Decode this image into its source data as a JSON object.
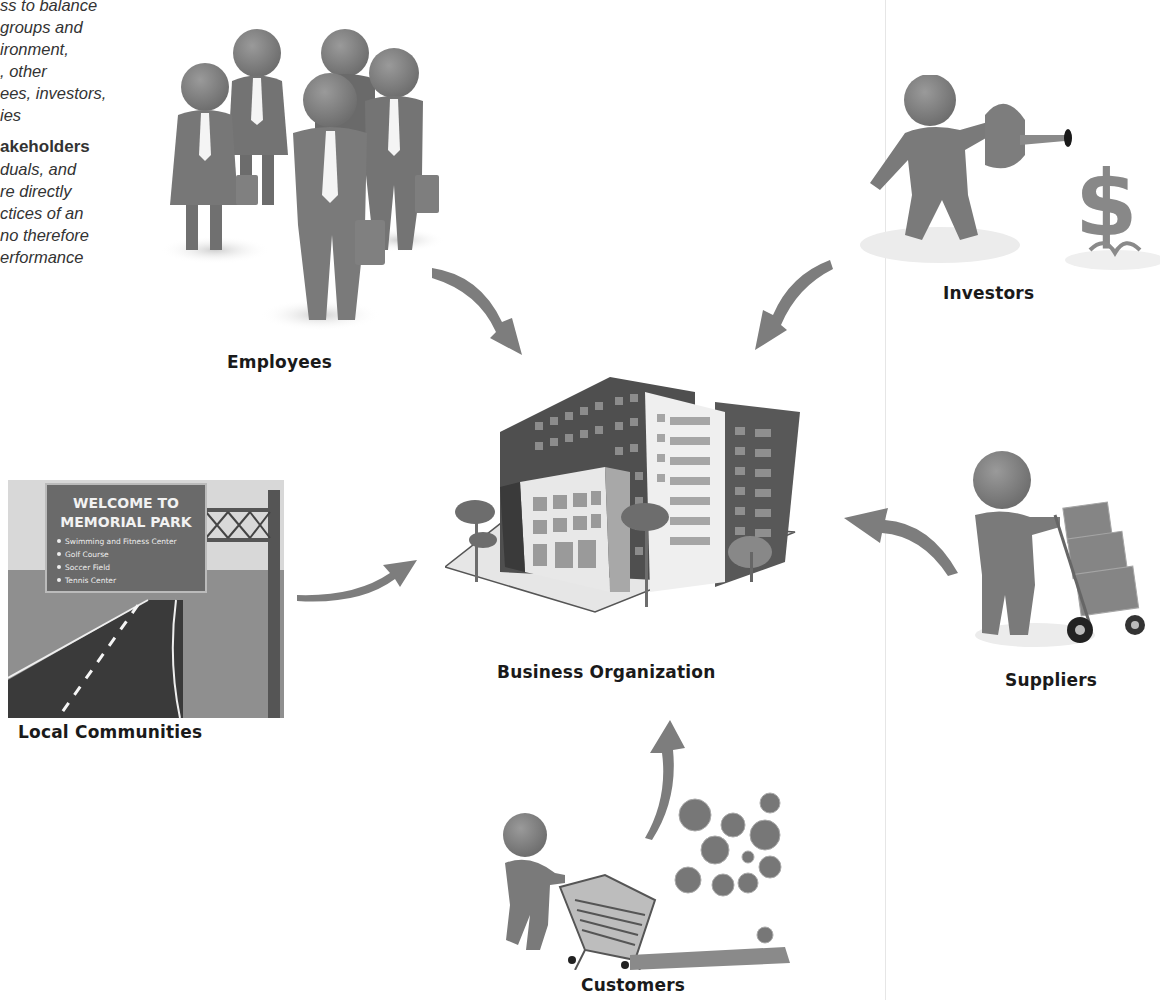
{
  "left_text": {
    "lines": [
      "ss to balance",
      "groups and",
      "ironment,",
      ", other",
      "ees, investors,",
      "ies"
    ],
    "term": "akeholders",
    "definition_lines": [
      "duals, and",
      "re directly",
      "ctices of an",
      "no therefore",
      "erformance"
    ]
  },
  "diagram": {
    "center": {
      "label": "Business Organization",
      "icon": "office-building"
    },
    "stakeholders": [
      {
        "id": "employees",
        "label": "Employees",
        "icon": "business-people-group",
        "arrow": "down-right"
      },
      {
        "id": "investors",
        "label": "Investors",
        "icon": "person-watering-dollar-plant",
        "arrow": "down-left"
      },
      {
        "id": "local_communities",
        "label": "Local Communities",
        "icon": "road-welcome-sign",
        "arrow": "right"
      },
      {
        "id": "suppliers",
        "label": "Suppliers",
        "icon": "person-with-hand-truck",
        "arrow": "left"
      },
      {
        "id": "customers",
        "label": "Customers",
        "icon": "person-with-shopping-cart",
        "arrow": "up"
      }
    ]
  },
  "sign": {
    "title_line1": "WELCOME TO",
    "title_line2": "MEMORIAL PARK",
    "items": [
      "Swimming and Fitness Center",
      "Golf Course",
      "Soccer Field",
      "Tennis Center"
    ]
  },
  "colors": {
    "figure_gray": "#7a7a7a",
    "arrow_gray": "#7d7d7d",
    "building_dark": "#4a4a4a",
    "label_text": "#1a1a1a"
  }
}
